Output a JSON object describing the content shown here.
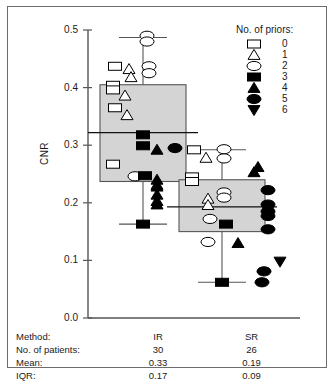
{
  "figure": {
    "frame_border_color": "#6c6c6c",
    "box_fill_color": "#d4d4d4",
    "line_color": "#555555",
    "marker_color": "#000000"
  },
  "axis": {
    "y_label": "CNR",
    "y_ticks": [
      "0.5",
      "0.4",
      "0.3",
      "0.2",
      "0.1",
      "0.0"
    ],
    "y_tick_values": [
      0.5,
      0.4,
      0.3,
      0.2,
      0.1,
      0.0
    ],
    "ylim": [
      0.0,
      0.5
    ]
  },
  "legend": {
    "title": "No. of priors:",
    "items": [
      {
        "label": "0",
        "symbol": "open-square"
      },
      {
        "label": "1",
        "symbol": "open-triangle-up"
      },
      {
        "label": "2",
        "symbol": "open-ellipse"
      },
      {
        "label": "3",
        "symbol": "filled-square"
      },
      {
        "label": "4",
        "symbol": "filled-triangle-up"
      },
      {
        "label": "5",
        "symbol": "filled-ellipse"
      },
      {
        "label": "6",
        "symbol": "filled-triangle-down"
      }
    ]
  },
  "table": {
    "rows": [
      {
        "key": "Method:",
        "ir": "IR",
        "sr": "SR"
      },
      {
        "key": "No. of patients:",
        "ir": "30",
        "sr": "26"
      },
      {
        "key": "Mean:",
        "ir": "0.33",
        "sr": "0.19"
      },
      {
        "key": "IQR:",
        "ir": "0.17",
        "sr": "0.09"
      }
    ]
  },
  "chart_data": {
    "type": "box",
    "title": "",
    "xlabel": "",
    "ylabel": "CNR",
    "ylim": [
      0.0,
      0.5
    ],
    "grid": false,
    "legend_position": "top-right",
    "categories": [
      "IR",
      "SR"
    ],
    "groups": [
      {
        "name": "IR",
        "n_patients": 30,
        "mean": 0.33,
        "iqr": 0.17,
        "box": {
          "q1": 0.237,
          "median": 0.322,
          "q3": 0.405
        },
        "whiskers": {
          "low": 0.163,
          "high": 0.487
        },
        "points": [
          {
            "value": 0.49,
            "priors": 2
          },
          {
            "value": 0.48,
            "priors": 2
          },
          {
            "value": 0.437,
            "priors": 0
          },
          {
            "value": 0.432,
            "priors": 1
          },
          {
            "value": 0.437,
            "priors": 2
          },
          {
            "value": 0.425,
            "priors": 2
          },
          {
            "value": 0.418,
            "priors": 1
          },
          {
            "value": 0.404,
            "priors": 0
          },
          {
            "value": 0.396,
            "priors": 0
          },
          {
            "value": 0.386,
            "priors": 1
          },
          {
            "value": 0.365,
            "priors": 0
          },
          {
            "value": 0.352,
            "priors": 1
          },
          {
            "value": 0.318,
            "priors": 3
          },
          {
            "value": 0.299,
            "priors": 3
          },
          {
            "value": 0.292,
            "priors": 4
          },
          {
            "value": 0.295,
            "priors": 5
          },
          {
            "value": 0.267,
            "priors": 0
          },
          {
            "value": 0.246,
            "priors": 2
          },
          {
            "value": 0.247,
            "priors": 3
          },
          {
            "value": 0.24,
            "priors": 4
          },
          {
            "value": 0.231,
            "priors": 4
          },
          {
            "value": 0.228,
            "priors": 4
          },
          {
            "value": 0.214,
            "priors": 4
          },
          {
            "value": 0.203,
            "priors": 4
          },
          {
            "value": 0.197,
            "priors": 4
          },
          {
            "value": 0.163,
            "priors": 3
          }
        ]
      },
      {
        "name": "SR",
        "n_patients": 26,
        "mean": 0.19,
        "iqr": 0.09,
        "box": {
          "q1": 0.15,
          "median": 0.193,
          "q3": 0.24
        },
        "whiskers": {
          "low": 0.062,
          "high": 0.292
        },
        "points": [
          {
            "value": 0.292,
            "priors": 0
          },
          {
            "value": 0.293,
            "priors": 2
          },
          {
            "value": 0.278,
            "priors": 1
          },
          {
            "value": 0.277,
            "priors": 2
          },
          {
            "value": 0.262,
            "priors": 4
          },
          {
            "value": 0.253,
            "priors": 4
          },
          {
            "value": 0.245,
            "priors": 0
          },
          {
            "value": 0.237,
            "priors": 0
          },
          {
            "value": 0.222,
            "priors": 5
          },
          {
            "value": 0.218,
            "priors": 2
          },
          {
            "value": 0.209,
            "priors": 2
          },
          {
            "value": 0.207,
            "priors": 1
          },
          {
            "value": 0.196,
            "priors": 1
          },
          {
            "value": 0.197,
            "priors": 5
          },
          {
            "value": 0.185,
            "priors": 5
          },
          {
            "value": 0.177,
            "priors": 5
          },
          {
            "value": 0.172,
            "priors": 2
          },
          {
            "value": 0.163,
            "priors": 3
          },
          {
            "value": 0.154,
            "priors": 5
          },
          {
            "value": 0.132,
            "priors": 2
          },
          {
            "value": 0.13,
            "priors": 4
          },
          {
            "value": 0.098,
            "priors": 6
          },
          {
            "value": 0.081,
            "priors": 5
          },
          {
            "value": 0.062,
            "priors": 3
          },
          {
            "value": 0.062,
            "priors": 5
          }
        ]
      }
    ]
  }
}
